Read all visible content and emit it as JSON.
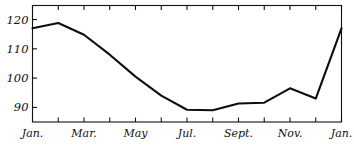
{
  "chart_data": {
    "type": "line",
    "title": "",
    "subtitle": "",
    "xlabel": "",
    "ylabel": "",
    "grid": false,
    "legend": "none",
    "axis": {
      "x_range_index": [
        0,
        12
      ],
      "ylim": [
        85,
        124.8
      ],
      "y_ticks": [
        90,
        100,
        110,
        120
      ],
      "y_tick_labels": [
        "90",
        "100",
        "110",
        "120"
      ],
      "x_ticks_index": [
        0,
        1,
        2,
        3,
        4,
        5,
        6,
        7,
        8,
        9,
        10,
        11,
        12
      ],
      "x_tick_labels": [
        "Jan.",
        "",
        "Mar.",
        "",
        "May",
        "",
        "Jul.",
        "",
        "Sept.",
        "",
        "Nov.",
        "",
        "Jan."
      ],
      "x_labels_visible": [
        "Jan.",
        "Mar.",
        "May",
        "Jul.",
        "Sept.",
        "Nov.",
        "Jan."
      ]
    },
    "categories": [
      "Jan.",
      "Feb.",
      "Mar.",
      "Apr.",
      "May",
      "Jun.",
      "Jul.",
      "Aug.",
      "Sept.",
      "Oct.",
      "Nov.",
      "Dec.",
      "Jan."
    ],
    "values": [
      117.0,
      118.8,
      114.8,
      108.0,
      100.5,
      94.0,
      89.2,
      89.0,
      91.3,
      91.6,
      96.5,
      93.0,
      117.0
    ],
    "series": [
      {
        "name": "series-1",
        "color": "#0d0d0d",
        "values": [
          117.0,
          118.8,
          114.8,
          108.0,
          100.5,
          94.0,
          89.2,
          89.0,
          91.3,
          91.6,
          96.5,
          93.0,
          117.0
        ]
      }
    ]
  },
  "colors": {
    "line": "#0d0d0d",
    "axis": "#111111",
    "background": "#ffffff",
    "text": "#111111"
  }
}
